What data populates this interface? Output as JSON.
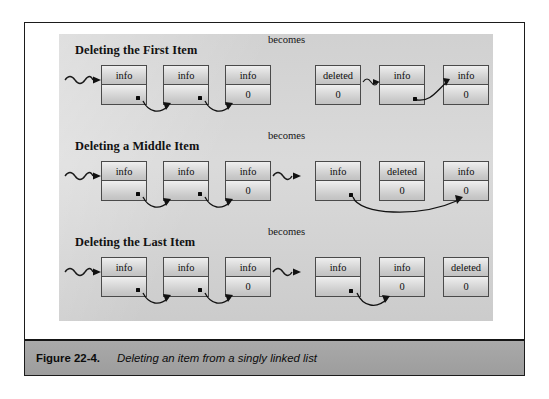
{
  "figure": {
    "caption_number": "Figure 22-4.",
    "caption_text": "Deleting an item from a singly linked list"
  },
  "labels": {
    "becomes": "becomes",
    "info": "info",
    "deleted": "deleted",
    "null": "0",
    "empty": ""
  },
  "rows": [
    {
      "title": "Deleting the First Item",
      "becomes": "becomes",
      "before": {
        "nodes": [
          {
            "top": "info",
            "bottom": "",
            "has_dot": true
          },
          {
            "top": "info",
            "bottom": "",
            "has_dot": true
          },
          {
            "top": "info",
            "bottom": "0",
            "has_dot": false
          }
        ],
        "head_pointer": "squiggle-arrow"
      },
      "after": {
        "nodes": [
          {
            "top": "deleted",
            "bottom": "0",
            "has_dot": false
          },
          {
            "top": "info",
            "bottom": "",
            "has_dot": true
          },
          {
            "top": "info",
            "bottom": "0",
            "has_dot": false
          }
        ],
        "head_pointer": "squiggle-arrow-between-deleted-and-info"
      }
    },
    {
      "title": "Deleting a Middle Item",
      "becomes": "becomes",
      "before": {
        "nodes": [
          {
            "top": "info",
            "bottom": "",
            "has_dot": true
          },
          {
            "top": "info",
            "bottom": "",
            "has_dot": true
          },
          {
            "top": "info",
            "bottom": "0",
            "has_dot": false
          }
        ],
        "head_pointer": "squiggle-arrow"
      },
      "after": {
        "nodes": [
          {
            "top": "info",
            "bottom": "",
            "has_dot": true
          },
          {
            "top": "deleted",
            "bottom": "0",
            "has_dot": false
          },
          {
            "top": "info",
            "bottom": "0",
            "has_dot": false
          }
        ],
        "head_pointer": "squiggle-arrow"
      }
    },
    {
      "title": "Deleting the Last Item",
      "becomes": "becomes",
      "before": {
        "nodes": [
          {
            "top": "info",
            "bottom": "",
            "has_dot": true
          },
          {
            "top": "info",
            "bottom": "",
            "has_dot": true
          },
          {
            "top": "info",
            "bottom": "0",
            "has_dot": false
          }
        ],
        "head_pointer": "squiggle-arrow"
      },
      "after": {
        "nodes": [
          {
            "top": "info",
            "bottom": "",
            "has_dot": true
          },
          {
            "top": "info",
            "bottom": "0",
            "has_dot": false
          },
          {
            "top": "deleted",
            "bottom": "0",
            "has_dot": false
          }
        ],
        "head_pointer": "squiggle-arrow"
      }
    }
  ],
  "colors": {
    "panel_background": "#d6d6d6",
    "caption_bar": "#a3a3a3",
    "node_border": "#4a4a4a",
    "node_fill_light": "#efefef",
    "node_fill_dark": "#c2c2c2",
    "ink": "#0d0d0d",
    "frame_border": "#1b1b1b"
  }
}
